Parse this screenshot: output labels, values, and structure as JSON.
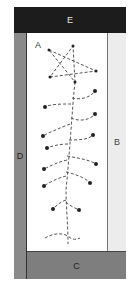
{
  "labels": {
    "A": "A",
    "B": "B",
    "C": "C",
    "D": "D",
    "E": "E"
  },
  "colors": {
    "E": "#1c1c1c",
    "D": "#8a8a8a",
    "B": "#ececec",
    "C": "#7e7e7e",
    "line": "#555555",
    "dot": "#222222"
  },
  "star_points": [
    [
      49,
      50
    ],
    [
      73,
      46
    ],
    [
      96,
      71
    ],
    [
      50,
      77
    ],
    [
      75,
      82
    ]
  ],
  "branch_dots": [
    [
      95,
      91
    ],
    [
      45,
      107
    ],
    [
      95,
      114
    ],
    [
      43,
      136
    ],
    [
      93,
      135
    ],
    [
      47,
      148
    ],
    [
      96,
      164
    ],
    [
      44,
      169
    ],
    [
      90,
      183
    ],
    [
      44,
      186
    ],
    [
      79,
      210
    ],
    [
      53,
      209
    ]
  ]
}
